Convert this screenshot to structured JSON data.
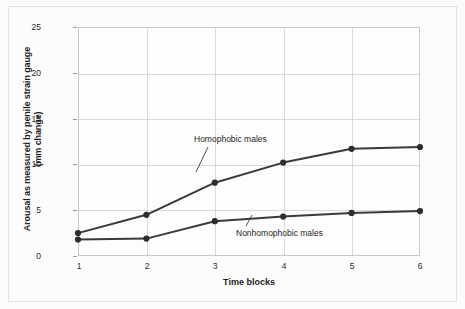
{
  "chart_data": {
    "type": "line",
    "title": "",
    "xlabel": "Time blocks",
    "ylabel": "Arousal as measured by penile strain gauge (mm change)",
    "ylabel_line1": "Arousal as measured by penile strain gauge",
    "ylabel_line2": "(mm change)",
    "categories": [
      "1",
      "2",
      "3",
      "4",
      "5",
      "6"
    ],
    "x": [
      1,
      2,
      3,
      4,
      5,
      6
    ],
    "xlim": [
      1,
      6
    ],
    "ylim": [
      0,
      25
    ],
    "yticks": [
      "0",
      "5",
      "10",
      "15",
      "20",
      "25"
    ],
    "ytick_values": [
      0,
      5,
      10,
      15,
      20,
      25
    ],
    "grid": true,
    "legend": "inline annotations",
    "series": [
      {
        "name": "Homophobic males",
        "values": [
          2.5,
          4.5,
          8.0,
          10.2,
          11.7,
          11.9
        ],
        "color": "#3a3a3a"
      },
      {
        "name": "Nonhomophobic males",
        "values": [
          1.8,
          1.9,
          3.8,
          4.3,
          4.7,
          4.9
        ],
        "color": "#3a3a3a"
      }
    ],
    "annotations": [
      {
        "text": "Homophobic males",
        "series": "Homophobic males"
      },
      {
        "text": "Nonhomophobic males",
        "series": "Nonhomophobic males"
      }
    ]
  },
  "style": {
    "line_color": "#3a3a3a",
    "marker_color": "#2d2d2d",
    "grid_color": "#dadada",
    "plot_border_color": "#c9c9c9",
    "background": "#fcfcfc",
    "text_color": "#1d1d1d"
  }
}
